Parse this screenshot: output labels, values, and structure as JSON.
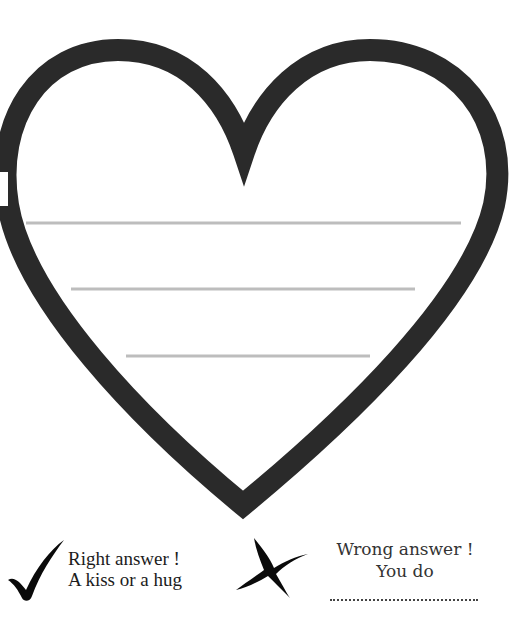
{
  "worksheet": {
    "heart": {
      "stroke_color": "#2a2a2a",
      "writing_lines_color": "#bdbdbd",
      "writing_lines": [
        {
          "y": 223,
          "x1": 26,
          "x2": 461
        },
        {
          "y": 289,
          "x1": 71,
          "x2": 415
        },
        {
          "y": 356,
          "x1": 126,
          "x2": 370
        }
      ]
    },
    "legend": {
      "right": {
        "icon": "checkmark-icon",
        "line1": "Right answer !",
        "line2": "A kiss or a hug"
      },
      "wrong": {
        "icon": "cross-icon",
        "line1": "Wrong answer !",
        "line2": "You do",
        "answer_blank": "........................................"
      }
    }
  }
}
